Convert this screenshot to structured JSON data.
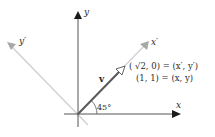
{
  "diagram": {
    "type": "rotated-coordinate-axes",
    "axes": {
      "x": {
        "label": "x"
      },
      "y": {
        "label": "y"
      },
      "x_prime": {
        "label": "x′"
      },
      "y_prime": {
        "label": "y′"
      }
    },
    "vector": {
      "label": "v"
    },
    "angle": {
      "label": "45°"
    },
    "annotations": {
      "primed_coords": "( √2, 0) = (x′, y′)",
      "standard_coords": "(1, 1) = (x, y)"
    },
    "colors": {
      "axes": "#222222",
      "rotated_axes": "#c8c8c8",
      "vector": "#555555",
      "text": "#2a2a2a"
    }
  }
}
